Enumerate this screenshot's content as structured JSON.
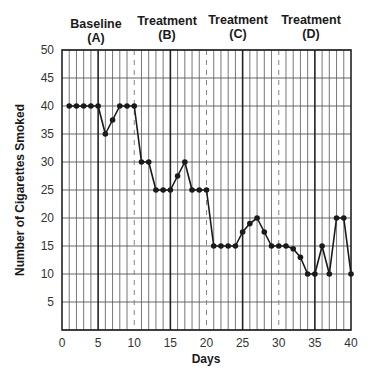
{
  "chart_data": {
    "type": "line",
    "title": "",
    "xlabel": "Days",
    "ylabel": "Number of Cigarettes Smoked",
    "xlim": [
      0,
      40
    ],
    "ylim": [
      0,
      50
    ],
    "x_ticks": [
      0,
      5,
      10,
      15,
      20,
      25,
      30,
      35,
      40
    ],
    "y_ticks": [
      5,
      10,
      15,
      20,
      25,
      30,
      35,
      40,
      45,
      50
    ],
    "grid": true,
    "phases": [
      {
        "name": "Baseline",
        "code": "(A)",
        "start": 0,
        "end": 5
      },
      {
        "name": "Treatment",
        "code": "(B)",
        "start": 5,
        "end": 15
      },
      {
        "name": "Treatment",
        "code": "(C)",
        "start": 15,
        "end": 25
      },
      {
        "name": "Treatment",
        "code": "(D)",
        "start": 25,
        "end": 35
      }
    ],
    "phase_boundaries_solid": [
      5,
      15,
      25,
      35
    ],
    "dashed_lines": [
      10,
      20,
      30
    ],
    "series": [
      {
        "name": "Cigarettes smoked",
        "x": [
          1,
          2,
          3,
          4,
          5,
          6,
          7,
          8,
          9,
          10,
          11,
          12,
          13,
          14,
          15,
          16,
          17,
          18,
          19,
          20,
          21,
          22,
          23,
          24,
          25,
          26,
          27,
          28,
          29,
          30,
          31,
          32,
          33,
          34,
          35,
          36,
          37,
          38,
          39,
          40
        ],
        "values": [
          40,
          40,
          40,
          40,
          40,
          35,
          37.5,
          40,
          40,
          40,
          30,
          30,
          25,
          25,
          25,
          27.5,
          30,
          25,
          25,
          25,
          15,
          15,
          15,
          15,
          17.5,
          19,
          20,
          17.5,
          15,
          15,
          15,
          14.5,
          13,
          10,
          10,
          15,
          10,
          20,
          20,
          10
        ]
      }
    ]
  },
  "labels": {
    "phase_a_name": "Baseline",
    "phase_a_code": "(A)",
    "phase_b_name": "Treatment",
    "phase_b_code": "(B)",
    "phase_c_name": "Treatment",
    "phase_c_code": "(C)",
    "phase_d_name": "Treatment",
    "phase_d_code": "(D)",
    "xlabel": "Days",
    "ylabel": "Number of Cigarettes Smoked"
  },
  "colors": {
    "line": "#1a1a1a",
    "grid": "#555555",
    "text": "#333333"
  }
}
